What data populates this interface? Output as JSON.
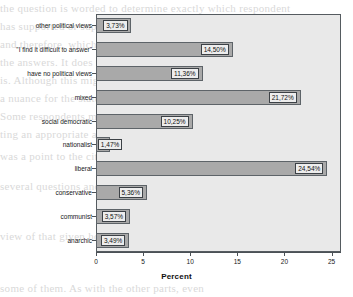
{
  "chart_data": {
    "type": "bar",
    "orientation": "horizontal",
    "title": "",
    "xlabel": "Percent",
    "ylabel": "",
    "xlim": [
      0,
      26
    ],
    "xticks": [
      0,
      5,
      10,
      15,
      20,
      25
    ],
    "xtick_labels": [
      "0",
      "5",
      "10",
      "15",
      "20",
      "25"
    ],
    "grid": false,
    "legend": null,
    "categories": [
      "other political views",
      "\"I find it difficult to answer\"",
      "have no political views",
      "mixed",
      "social democratic",
      "nationalist",
      "liberal",
      "conservative",
      "communist",
      "anarchic"
    ],
    "values": [
      3.73,
      14.5,
      11.36,
      21.72,
      10.25,
      1.47,
      24.54,
      5.36,
      3.57,
      3.49
    ],
    "data_labels": [
      "3,73%",
      "14,50%",
      "11,36%",
      "21,72%",
      "10,25%",
      "1,47%",
      "24,54%",
      "5,36%",
      "3,57%",
      "3,49%"
    ],
    "colors": {
      "bar_fill": "#a9a9a9",
      "bar_edge": "#5d6368",
      "plot_background": "#e9e9e9",
      "frame": "#555b60",
      "label_box_fill": "#ededed",
      "text": "#111111"
    }
  },
  "background_text": {
    "lines": [
      "the question is worded to determine exactly which respondent",
      "has supported or supports in the recent past,",
      "and therefore, which were provided in",
      "the answers. It does not show what it",
      "is. Although this might be regarded as",
      "a nuance for the statement.",
      "Some respondents mentioned that suppor-",
      "ting an appropriate attitude to support one",
      "was a point to the citizens by reference to",
      "several questions and had in consequence of",
      "view of that given how the text and how",
      "some of them. As with the other parts, even"
    ]
  }
}
